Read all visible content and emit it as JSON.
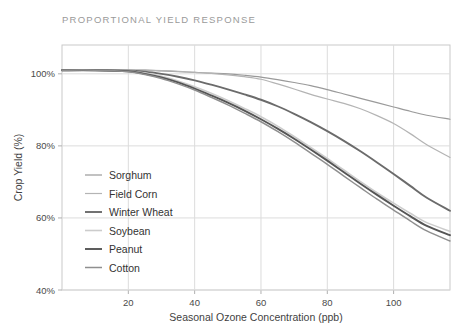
{
  "chart_data": {
    "type": "line",
    "title": "PROPORTIONAL YIELD RESPONSE",
    "xlabel": "Seasonal Ozone Concentration (ppb)",
    "ylabel": "Crop Yield (%)",
    "xlim": [
      0,
      117
    ],
    "ylim": [
      40,
      108
    ],
    "xticks": [
      20,
      40,
      60,
      80,
      100
    ],
    "xtick_labels": [
      "20",
      "40",
      "60",
      "80",
      "100"
    ],
    "yticks": [
      40,
      60,
      80,
      100
    ],
    "ytick_labels": [
      "40%",
      "60%",
      "80%",
      "100%"
    ],
    "grid": true,
    "legend_position": "inside-left",
    "x": [
      0,
      10,
      20,
      25,
      30,
      35,
      40,
      45,
      50,
      55,
      60,
      65,
      70,
      75,
      80,
      85,
      90,
      95,
      100,
      105,
      110,
      117
    ],
    "series": [
      {
        "name": "Sorghum",
        "color": "#9a9a9a",
        "width": 1.2,
        "values": [
          101,
          101,
          101,
          101,
          100.8,
          100.6,
          100.4,
          100.2,
          100,
          99.6,
          99.1,
          98.4,
          97.6,
          96.7,
          95.6,
          94.4,
          93.2,
          92.0,
          90.8,
          89.6,
          88.5,
          87.4
        ]
      },
      {
        "name": "Field Corn",
        "color": "#b4b4b4",
        "width": 1.2,
        "values": [
          101,
          101,
          101,
          101,
          100.9,
          100.7,
          100.4,
          100.1,
          99.7,
          99.2,
          98.5,
          97.2,
          95.8,
          94.3,
          93.0,
          91.8,
          90.3,
          88.4,
          86.2,
          83.4,
          80.3,
          76.8
        ]
      },
      {
        "name": "Winter Wheat",
        "color": "#6b6b6b",
        "width": 1.9,
        "values": [
          101,
          101,
          100.9,
          100.6,
          100.0,
          99.2,
          98.2,
          97.0,
          95.7,
          94.3,
          92.8,
          91.0,
          88.9,
          86.6,
          84.1,
          81.4,
          78.5,
          75.4,
          72.2,
          68.9,
          65.6,
          62.0
        ]
      },
      {
        "name": "Soybean",
        "color": "#cccccc",
        "width": 1.6,
        "values": [
          101,
          101,
          100.8,
          100.2,
          99.3,
          98.0,
          96.4,
          94.6,
          92.6,
          90.4,
          88.1,
          85.5,
          82.6,
          79.6,
          76.5,
          73.3,
          70.1,
          67.0,
          64.1,
          61.3,
          58.7,
          56.3
        ]
      },
      {
        "name": "Peanut",
        "color": "#555555",
        "width": 1.9,
        "values": [
          101,
          101,
          100.7,
          100.0,
          99.0,
          97.6,
          95.9,
          94.0,
          92.0,
          89.8,
          87.4,
          84.8,
          82.0,
          79.0,
          75.9,
          72.7,
          69.5,
          66.4,
          63.4,
          60.5,
          57.8,
          55.2
        ]
      },
      {
        "name": "Cotton",
        "color": "#8f8f8f",
        "width": 1.5,
        "values": [
          101,
          101,
          100.6,
          99.8,
          98.7,
          97.2,
          95.5,
          93.5,
          91.4,
          89.1,
          86.7,
          84.0,
          81.1,
          78.0,
          74.9,
          71.6,
          68.4,
          65.2,
          62.2,
          59.2,
          56.4,
          53.6
        ]
      }
    ]
  },
  "legend": {
    "items": [
      {
        "label": "Sorghum"
      },
      {
        "label": "Field Corn"
      },
      {
        "label": "Winter Wheat"
      },
      {
        "label": "Soybean"
      },
      {
        "label": "Peanut"
      },
      {
        "label": "Cotton"
      }
    ]
  }
}
